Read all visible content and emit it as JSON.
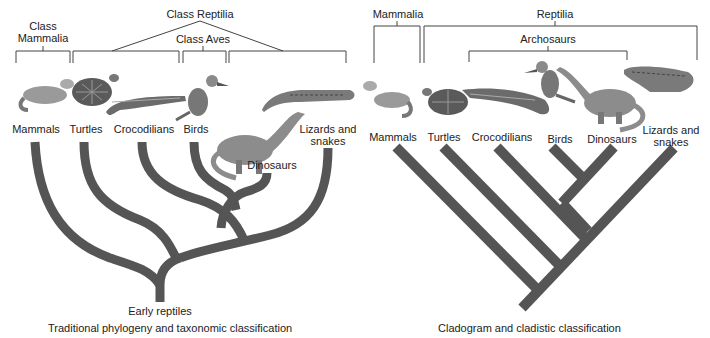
{
  "colors": {
    "branch": "#555555",
    "bracket": "#444444",
    "text": "#222222"
  },
  "left_panel": {
    "caption": "Traditional phylogeny and taxonomic classification",
    "root_label": "Early reptiles",
    "groups": {
      "mammalia_line1": "Class",
      "mammalia_line2": "Mammalia",
      "reptilia": "Class Reptilia",
      "aves": "Class Aves"
    },
    "taxa": [
      {
        "label": "Mammals",
        "icon": "ferret"
      },
      {
        "label": "Turtles",
        "icon": "turtle"
      },
      {
        "label": "Crocodilians",
        "icon": "crocodile"
      },
      {
        "label": "Birds",
        "icon": "kingfisher"
      },
      {
        "label": "Dinosaurs",
        "icon": "sauropod"
      },
      {
        "label_line1": "Lizards and",
        "label_line2": "snakes",
        "icon": "lizard"
      }
    ]
  },
  "right_panel": {
    "caption": "Cladogram and cladistic classification",
    "groups": {
      "mammalia": "Mammalia",
      "reptilia": "Reptilia",
      "archosaurs": "Archosaurs"
    },
    "taxa": [
      {
        "label": "Mammals",
        "icon": "ferret"
      },
      {
        "label": "Turtles",
        "icon": "turtle"
      },
      {
        "label": "Crocodilians",
        "icon": "crocodile"
      },
      {
        "label": "Birds",
        "icon": "kingfisher"
      },
      {
        "label": "Dinosaurs",
        "icon": "sauropod"
      },
      {
        "label_line1": "Lizards and",
        "label_line2": "snakes",
        "icon": "lizard"
      }
    ]
  }
}
